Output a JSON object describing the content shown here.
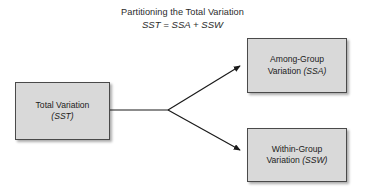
{
  "diagram": {
    "title": "Partitioning the Total Variation",
    "formula": "SST = SSA + SSW",
    "background_color": "#ffffff",
    "node_fill_color": "#d9d9d9",
    "node_border_color": "#4a4a4a",
    "connector_color": "#1a1a1a",
    "nodes": {
      "total": {
        "line1": "Total Variation",
        "line2": "(SST)"
      },
      "among": {
        "line1": "Among-Group",
        "line2_plain": "Variation ",
        "line2_italic": "(SSA)"
      },
      "within": {
        "line1": "Within-Group",
        "line2_plain": "Variation ",
        "line2_italic": "(SSW)"
      }
    },
    "connectors": {
      "trunk_label": "total-variation-trunk",
      "arrow_upper_label": "arrow-to-among-group",
      "arrow_lower_label": "arrow-to-within-group"
    }
  }
}
